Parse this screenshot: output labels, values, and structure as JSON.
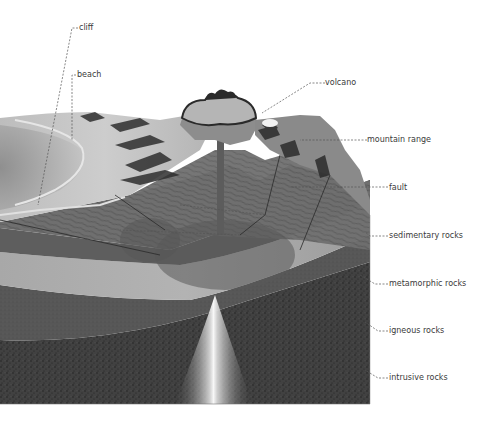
{
  "diagram": {
    "labels": [
      {
        "id": "cliff",
        "text": "cliff",
        "x": 79,
        "y": 23
      },
      {
        "id": "beach",
        "text": "beach",
        "x": 77,
        "y": 70
      },
      {
        "id": "volcano",
        "text": "volcano",
        "x": 325,
        "y": 78
      },
      {
        "id": "mountain-range",
        "text": "mountain range",
        "x": 367,
        "y": 135
      },
      {
        "id": "fault",
        "text": "fault",
        "x": 389,
        "y": 183
      },
      {
        "id": "sedimentary-rocks",
        "text": "sedimentary rocks",
        "x": 389,
        "y": 231
      },
      {
        "id": "metamorphic-rocks",
        "text": "metamorphic rocks",
        "x": 389,
        "y": 279
      },
      {
        "id": "igneous-rocks",
        "text": "igneous rocks",
        "x": 389,
        "y": 326
      },
      {
        "id": "intrusive-rocks",
        "text": "intrusive rocks",
        "x": 389,
        "y": 373
      }
    ],
    "colors": {
      "background": "#ffffff",
      "surface_light": "#c8c8c8",
      "sea_dark": "#9a9a9a",
      "sedimentary": "#6e6e6e",
      "metamorphic": "#a9a9a9",
      "igneous": "#5a5a5a",
      "intrusive": "#3e3e3e",
      "magma_glow": "#f2f2f2",
      "label_text": "#3a3a3a",
      "leader_line": "#555555"
    }
  }
}
